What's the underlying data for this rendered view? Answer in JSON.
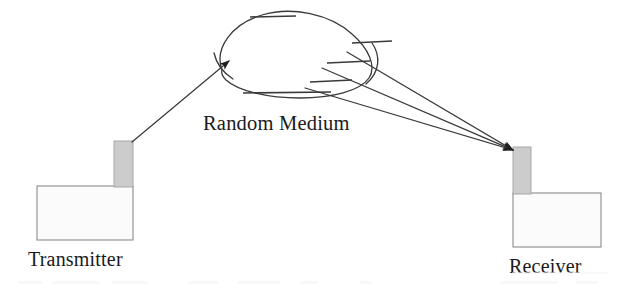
{
  "figure": {
    "type": "schematic-diagram",
    "title_visible": false,
    "background_color": "#ffffff",
    "ink_color": "#3a3a3a",
    "structure_fill_color": "#fbfbfb",
    "tower_fill_color": "#cccccc",
    "width": 629,
    "height": 292
  },
  "labels": {
    "transmitter": "Transmitter",
    "receiver": "Receiver",
    "random_medium": "Random Medium"
  },
  "nodes": {
    "transmitter": {
      "label": "Transmitter",
      "base_box": {
        "x": 37,
        "y": 186,
        "width": 96,
        "height": 54
      },
      "tower": {
        "x": 114,
        "y": 141,
        "width": 19,
        "height": 46
      },
      "antenna_point": {
        "x": 132,
        "y": 142
      },
      "label_position": {
        "x": 28,
        "y": 266
      }
    },
    "receiver": {
      "label": "Receiver",
      "base_box": {
        "x": 513,
        "y": 193,
        "width": 88,
        "height": 54
      },
      "tower": {
        "x": 513,
        "y": 147,
        "width": 18,
        "height": 47
      },
      "antenna_point": {
        "x": 514,
        "y": 150
      },
      "label_position": {
        "x": 509,
        "y": 273
      }
    },
    "random_medium": {
      "label": "Random Medium",
      "label_position": {
        "x": 203,
        "y": 130
      },
      "blob_center": {
        "x": 285,
        "y": 55
      },
      "blob_width": 160,
      "blob_height": 85
    }
  },
  "paths": {
    "incident_ray": {
      "name": "transmitter-to-medium-ray",
      "from": {
        "x": 132,
        "y": 142
      },
      "to": {
        "x": 229,
        "y": 61
      },
      "has_arrowhead": true,
      "arrow_at": "to"
    },
    "scattered_rays": [
      {
        "name": "scattered-ray-upper",
        "from": {
          "x": 347,
          "y": 52
        },
        "to": {
          "x": 513,
          "y": 150
        },
        "has_arrowhead": true
      },
      {
        "name": "scattered-ray-middle",
        "from": {
          "x": 322,
          "y": 68
        },
        "to": {
          "x": 513,
          "y": 150
        },
        "has_arrowhead": true
      },
      {
        "name": "scattered-ray-lower",
        "from": {
          "x": 305,
          "y": 88
        },
        "to": {
          "x": 513,
          "y": 150
        },
        "has_arrowhead": true
      }
    ],
    "hatch_marks": [
      {
        "name": "hatch-top",
        "x1": 250,
        "y1": 17,
        "x2": 296,
        "y2": 16
      },
      {
        "name": "hatch-bottom",
        "x1": 243,
        "y1": 93,
        "x2": 331,
        "y2": 92
      },
      {
        "name": "hatch-inner-upper",
        "x1": 352,
        "y1": 43,
        "x2": 392,
        "y2": 41
      },
      {
        "name": "hatch-inner-mid",
        "x1": 327,
        "y1": 63,
        "x2": 370,
        "y2": 61
      },
      {
        "name": "hatch-inner-low",
        "x1": 310,
        "y1": 82,
        "x2": 352,
        "y2": 80
      }
    ],
    "medium_arc": {
      "name": "medium-edge-arc",
      "description": "short arc crossing the right edge of the blob"
    }
  }
}
